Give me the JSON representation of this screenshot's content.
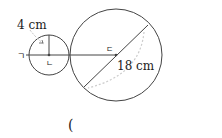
{
  "diagram": {
    "small_circle": {
      "radius_label": "4 cm",
      "center_label": "ㄴ"
    },
    "large_circle": {
      "diameter_label": "18 cm",
      "center_label": "ㄷ"
    },
    "point_left_label": "ㄱ",
    "small_arc_mark": "ㄱ",
    "answer_blank": "("
  }
}
